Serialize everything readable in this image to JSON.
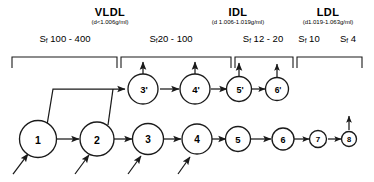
{
  "diagram": {
    "classes": [
      {
        "name": "VLDL",
        "density": "(d<1.006g/ml)"
      },
      {
        "name": "IDL",
        "density": "(d 1.006-1.019g/ml)"
      },
      {
        "name": "LDL",
        "density": "(d1.019-1.063g/ml)"
      }
    ],
    "sf_labels": [
      {
        "prefix": "S",
        "sub": "f",
        "range": "100 - 400"
      },
      {
        "prefix": "S",
        "sub": "f",
        "range": "20 - 100"
      },
      {
        "prefix": "S",
        "sub": "f",
        "range": "12 - 20"
      },
      {
        "prefix": "S",
        "sub": "f",
        "range": "10"
      },
      {
        "prefix": "S",
        "sub": "f",
        "range": "4"
      }
    ],
    "bottom_row_nodes": [
      "1",
      "2",
      "3",
      "4",
      "5",
      "6",
      "7",
      "8"
    ],
    "top_row_nodes": [
      "3'",
      "4'",
      "5'",
      "6'"
    ],
    "colors": {
      "ink": "#1a1a1a",
      "paper": "#ffffff"
    }
  }
}
